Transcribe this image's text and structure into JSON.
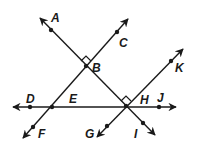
{
  "diagram": {
    "type": "geometry-lines",
    "stroke_color": "#1a1a1a",
    "background": "#ffffff",
    "labels": {
      "A": "A",
      "B": "B",
      "C": "C",
      "D": "D",
      "E": "E",
      "F": "F",
      "G": "G",
      "H": "H",
      "I": "I",
      "J": "J",
      "K": "K"
    },
    "right_angle_marks": [
      "B",
      "H"
    ],
    "lines": [
      {
        "name": "line-AI",
        "through": [
          "A",
          "B",
          "H",
          "I"
        ]
      },
      {
        "name": "line-CF",
        "through": [
          "C",
          "B",
          "E",
          "F"
        ]
      },
      {
        "name": "line-DJ",
        "through": [
          "D",
          "E",
          "H",
          "J"
        ]
      },
      {
        "name": "line-GK",
        "through": [
          "G",
          "H",
          "K"
        ]
      }
    ]
  }
}
